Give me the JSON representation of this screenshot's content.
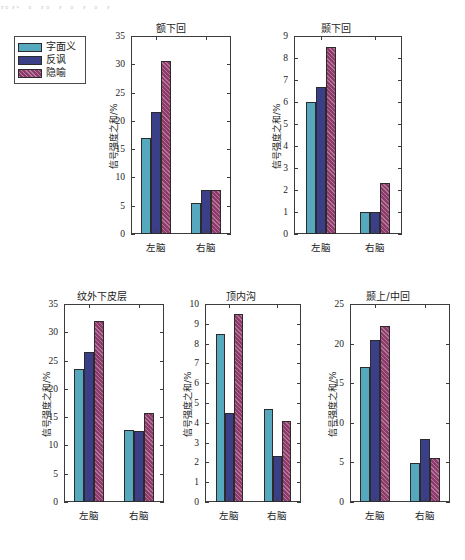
{
  "scan_artifacts": {
    "top_line": "，。，、 。 ，。 ， 。 ， 。 ，",
    "bottom_line": ""
  },
  "legend": {
    "items": [
      {
        "label": "字面义",
        "color": "#55a8bd",
        "hatch": false
      },
      {
        "label": "反讽",
        "color": "#3b3f87",
        "hatch": false
      },
      {
        "label": "隐喻",
        "color": "#8e3a6b",
        "hatch": true
      }
    ]
  },
  "axis_label_y": "信号强度之和/%",
  "categories": [
    "左脑",
    "右脑"
  ],
  "chart_data": [
    {
      "type": "bar",
      "title": "额下回",
      "xlabel": "",
      "ylabel": "信号强度之和/%",
      "categories": [
        "左脑",
        "右脑"
      ],
      "ylim": [
        0,
        35
      ],
      "yticks": [
        0,
        5,
        10,
        15,
        20,
        25,
        30,
        35
      ],
      "grid": false,
      "legend_position": "outside-left",
      "series": [
        {
          "name": "字面义",
          "values": [
            17.0,
            5.5
          ]
        },
        {
          "name": "反讽",
          "values": [
            21.5,
            7.8
          ]
        },
        {
          "name": "隐喻",
          "values": [
            30.5,
            7.8
          ]
        }
      ]
    },
    {
      "type": "bar",
      "title": "颞下回",
      "xlabel": "",
      "ylabel": "信号强度之和/%",
      "categories": [
        "左脑",
        "右脑"
      ],
      "ylim": [
        0,
        9
      ],
      "yticks": [
        0,
        1,
        2,
        3,
        4,
        5,
        6,
        7,
        8,
        9
      ],
      "grid": false,
      "legend_position": "none",
      "series": [
        {
          "name": "字面义",
          "values": [
            6.0,
            1.0
          ]
        },
        {
          "name": "反讽",
          "values": [
            6.7,
            1.0
          ]
        },
        {
          "name": "隐喻",
          "values": [
            8.5,
            2.3
          ]
        }
      ]
    },
    {
      "type": "bar",
      "title": "纹外下皮层",
      "xlabel": "",
      "ylabel": "信号强度之和/%",
      "categories": [
        "左脑",
        "右脑"
      ],
      "ylim": [
        0,
        35
      ],
      "yticks": [
        0,
        5,
        10,
        15,
        20,
        25,
        30,
        35
      ],
      "grid": false,
      "legend_position": "none",
      "series": [
        {
          "name": "字面义",
          "values": [
            23.5,
            12.7
          ]
        },
        {
          "name": "反讽",
          "values": [
            26.5,
            12.5
          ]
        },
        {
          "name": "隐喻",
          "values": [
            32.0,
            15.7
          ]
        }
      ]
    },
    {
      "type": "bar",
      "title": "顶内沟",
      "xlabel": "",
      "ylabel": "信号强度之和/%",
      "categories": [
        "左脑",
        "右脑"
      ],
      "ylim": [
        0,
        10
      ],
      "yticks": [
        0,
        1,
        2,
        3,
        4,
        5,
        6,
        7,
        8,
        9,
        10
      ],
      "grid": false,
      "legend_position": "none",
      "series": [
        {
          "name": "字面义",
          "values": [
            8.5,
            4.7
          ]
        },
        {
          "name": "反讽",
          "values": [
            4.5,
            2.3
          ]
        },
        {
          "name": "隐喻",
          "values": [
            9.5,
            4.1
          ]
        }
      ]
    },
    {
      "type": "bar",
      "title": "颞上/中回",
      "xlabel": "",
      "ylabel": "信号强度之和/%",
      "categories": [
        "左脑",
        "右脑"
      ],
      "ylim": [
        0,
        25
      ],
      "yticks": [
        0,
        5,
        10,
        15,
        20,
        25
      ],
      "grid": false,
      "legend_position": "none",
      "series": [
        {
          "name": "字面义",
          "values": [
            17.0,
            4.9
          ]
        },
        {
          "name": "反讽",
          "values": [
            20.5,
            8.0
          ]
        },
        {
          "name": "隐喻",
          "values": [
            22.2,
            5.5
          ]
        }
      ]
    }
  ],
  "panels": [
    {
      "left": 103,
      "top": 20,
      "width": 136,
      "height": 245,
      "plot_left": 28,
      "plot_top": 16,
      "plot_w": 100,
      "plot_h": 198,
      "ylabel_show": true
    },
    {
      "left": 262,
      "top": 20,
      "width": 148,
      "height": 245,
      "plot_left": 32,
      "plot_top": 16,
      "plot_w": 108,
      "plot_h": 198,
      "ylabel_show": true
    },
    {
      "left": 32,
      "top": 288,
      "width": 140,
      "height": 245,
      "plot_left": 32,
      "plot_top": 16,
      "plot_w": 100,
      "plot_h": 198,
      "ylabel_show": true
    },
    {
      "left": 175,
      "top": 288,
      "width": 132,
      "height": 245,
      "plot_left": 30,
      "plot_top": 16,
      "plot_w": 96,
      "plot_h": 198,
      "ylabel_show": true
    },
    {
      "left": 318,
      "top": 288,
      "width": 140,
      "height": 245,
      "plot_left": 32,
      "plot_top": 16,
      "plot_w": 100,
      "plot_h": 198,
      "ylabel_show": true
    }
  ]
}
